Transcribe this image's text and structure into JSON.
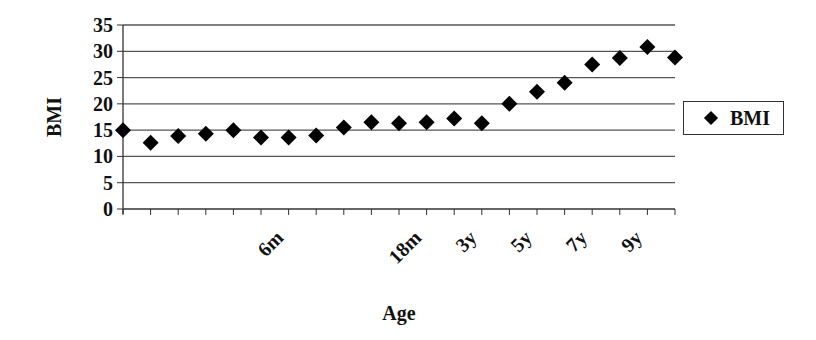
{
  "chart_data": {
    "type": "scatter",
    "title": "",
    "xlabel": "Age",
    "ylabel": "BMI",
    "ylim": [
      0,
      35
    ],
    "yticks": [
      0,
      5,
      10,
      15,
      20,
      25,
      30,
      35
    ],
    "grid": "horizontal",
    "legend_position": "right",
    "categories": [
      "",
      "",
      "",
      "",
      "",
      "",
      "6m",
      "",
      "",
      "",
      "",
      "18m",
      "",
      "3y",
      "",
      "5y",
      "",
      "7y",
      "",
      "9y",
      ""
    ],
    "series": [
      {
        "name": "BMI",
        "marker": "diamond",
        "color": "#000000",
        "values": [
          15.0,
          12.6,
          13.9,
          14.3,
          15.0,
          13.6,
          13.6,
          14.0,
          15.5,
          16.5,
          16.3,
          16.5,
          17.2,
          16.3,
          20.0,
          22.3,
          24.0,
          27.5,
          28.7,
          30.8,
          28.8
        ]
      }
    ]
  },
  "legend": {
    "label": "BMI"
  }
}
